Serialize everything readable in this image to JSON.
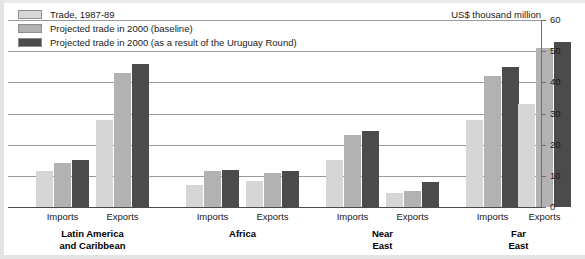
{
  "legend": {
    "items": [
      {
        "label": "Trade, 1987-89",
        "color": "#d6d6d6",
        "swatch_name": "legend-swatch-trade-1987-89"
      },
      {
        "label": "Projected trade in 2000 (baseline)",
        "color": "#b2b2b2",
        "swatch_name": "legend-swatch-projected-baseline"
      },
      {
        "label": "Projected trade in 2000 (as a result of the Uruguay Round)",
        "color": "#4b4b4b",
        "swatch_name": "legend-swatch-projected-uruguay"
      }
    ]
  },
  "units_caption": "US$ thousand million",
  "axis": {
    "tick_labels": [
      "60",
      "50",
      "40",
      "30",
      "20",
      "10",
      "0"
    ]
  },
  "groups": [
    {
      "name": "Latin America and Caribbean",
      "label_line1": "Latin America",
      "label_line2": "and Caribbean",
      "subgroups": [
        "Imports",
        "Exports"
      ]
    },
    {
      "name": "Africa",
      "label_line1": "Africa",
      "label_line2": "",
      "subgroups": [
        "Imports",
        "Exports"
      ]
    },
    {
      "name": "Near East",
      "label_line1": "Near",
      "label_line2": "East",
      "subgroups": [
        "Imports",
        "Exports"
      ]
    },
    {
      "name": "Far East",
      "label_line1": "Far",
      "label_line2": "East",
      "subgroups": [
        "Imports",
        "Exports"
      ]
    }
  ],
  "chart_data": {
    "type": "bar",
    "title": "",
    "subtitle": "",
    "xlabel": "",
    "ylabel": "US$ thousand million",
    "ylim": [
      0,
      60
    ],
    "ytick_step": 10,
    "yticks": [
      0,
      10,
      20,
      30,
      40,
      50,
      60
    ],
    "grid": true,
    "legend_position": "top-left",
    "axis_position": "right",
    "categories": [
      "Latin America and Caribbean - Imports",
      "Latin America and Caribbean - Exports",
      "Africa - Imports",
      "Africa - Exports",
      "Near East - Imports",
      "Near East - Exports",
      "Far East - Imports",
      "Far East - Exports"
    ],
    "series": [
      {
        "name": "Trade, 1987-89",
        "color": "#d6d6d6",
        "values": [
          11.5,
          28,
          7,
          8.5,
          15,
          4.5,
          28,
          33
        ]
      },
      {
        "name": "Projected trade in 2000 (baseline)",
        "color": "#b2b2b2",
        "values": [
          14,
          43,
          11.5,
          11,
          23,
          5,
          42,
          51
        ]
      },
      {
        "name": "Projected trade in 2000 (as a result of the Uruguay Round)",
        "color": "#4b4b4b",
        "values": [
          15,
          46,
          12,
          11.5,
          24.5,
          8,
          45,
          53
        ]
      }
    ]
  }
}
